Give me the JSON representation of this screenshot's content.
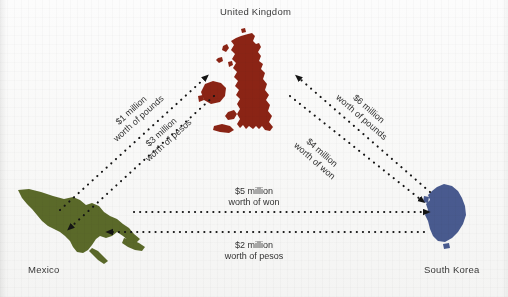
{
  "figure": {
    "type": "trade-flow-diagram",
    "background_color": "#fcfcfc"
  },
  "nodes": [
    {
      "id": "united-kingdom",
      "label": "United Kingdom",
      "label_position": "top",
      "shape_color": "#8c2415"
    },
    {
      "id": "mexico",
      "label": "Mexico",
      "label_position": "bottom-left",
      "shape_color": "#5c6b2a"
    },
    {
      "id": "south-korea",
      "label": "South Korea",
      "label_position": "bottom-right",
      "shape_color": "#4a5c92"
    }
  ],
  "flows": [
    {
      "id": "mexico-to-uk",
      "from": "mexico",
      "to": "united-kingdom",
      "amount": "$1 million",
      "currency_line": "worth of pounds",
      "line_style": "dotted",
      "arrow_color": "#1a1a1a"
    },
    {
      "id": "uk-to-mexico",
      "from": "united-kingdom",
      "to": "mexico",
      "amount": "$3 million",
      "currency_line": "worth of pesos",
      "line_style": "dotted",
      "arrow_color": "#1a1a1a"
    },
    {
      "id": "southkorea-to-uk",
      "from": "south-korea",
      "to": "united-kingdom",
      "amount": "$6 million",
      "currency_line": "worth of pounds",
      "line_style": "dotted",
      "arrow_color": "#1a1a1a"
    },
    {
      "id": "uk-to-southkorea",
      "from": "united-kingdom",
      "to": "south-korea",
      "amount": "$4 million",
      "currency_line": "worth of won",
      "line_style": "dotted",
      "arrow_color": "#1a1a1a"
    },
    {
      "id": "mexico-to-southkorea",
      "from": "mexico",
      "to": "south-korea",
      "amount": "$5 million",
      "currency_line": "worth of won",
      "line_style": "dotted",
      "arrow_color": "#1a1a1a"
    },
    {
      "id": "southkorea-to-mexico",
      "from": "south-korea",
      "to": "mexico",
      "amount": "$2 million",
      "currency_line": "worth of pesos",
      "line_style": "dotted",
      "arrow_color": "#1a1a1a"
    }
  ]
}
